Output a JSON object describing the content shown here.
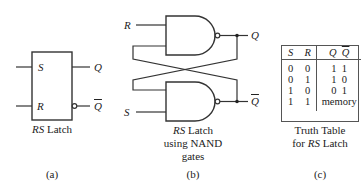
{
  "panel_a": {
    "inputs": {
      "s": "S",
      "r": "R"
    },
    "outputs": {
      "q": "Q",
      "q_bar": "Q"
    },
    "caption_italic": "RS",
    "caption_rest": " Latch",
    "label": "(a)"
  },
  "panel_b": {
    "inputs": {
      "r": "R",
      "s": "S"
    },
    "outputs": {
      "q": "Q",
      "q_bar": "Q"
    },
    "caption_line1_italic": "RS",
    "caption_line1_rest": " Latch",
    "caption_line2": "using NAND",
    "caption_line3": "gates",
    "label": "(b)"
  },
  "panel_c": {
    "headers": {
      "s": "S",
      "r": "R",
      "q": "Q",
      "q_bar": "Q"
    },
    "rows": [
      {
        "s": "0",
        "r": "0",
        "out": "1  1"
      },
      {
        "s": "0",
        "r": "1",
        "out": "1  0"
      },
      {
        "s": "1",
        "r": "0",
        "out": "0  1"
      },
      {
        "s": "1",
        "r": "1",
        "out": "memory"
      }
    ],
    "caption_line1": "Truth Table",
    "caption_line2_pre": "for ",
    "caption_line2_italic": "RS",
    "caption_line2_rest": " Latch",
    "label": "(c)"
  }
}
